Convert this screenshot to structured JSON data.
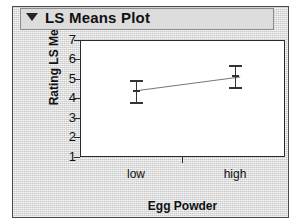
{
  "panel": {
    "title": "LS Means Plot",
    "disclosure_icon": "triangle-down-icon",
    "background_color": "#d8d8d8",
    "border_color": "#4a4a4a"
  },
  "chart_data": {
    "type": "line",
    "title": "LS Means Plot",
    "xlabel": "Egg Powder",
    "ylabel": "Rating LS Means",
    "categories": [
      "low",
      "high"
    ],
    "values": [
      4.45,
      5.15
    ],
    "error_low": [
      4.0,
      4.8
    ],
    "error_high": [
      4.85,
      5.55
    ],
    "error_bars": true,
    "ylim": [
      1,
      7
    ],
    "yticks": [
      7,
      6,
      5,
      4,
      3,
      2,
      1
    ],
    "ytick_labels": [
      "7",
      "6",
      "5",
      "4",
      "3",
      "2",
      "1"
    ],
    "xtick_labels": [
      "low",
      "high"
    ],
    "grid": false,
    "legend": false,
    "series": [
      {
        "name": "Rating LS Means",
        "values": [
          4.45,
          5.15
        ],
        "error_low": [
          4.0,
          4.8
        ],
        "error_high": [
          4.85,
          5.55
        ]
      }
    ],
    "line_color": "#777777",
    "marker_color": "#333333",
    "plot_background": "#ffffff",
    "axis_color": "#2b2b2b"
  }
}
